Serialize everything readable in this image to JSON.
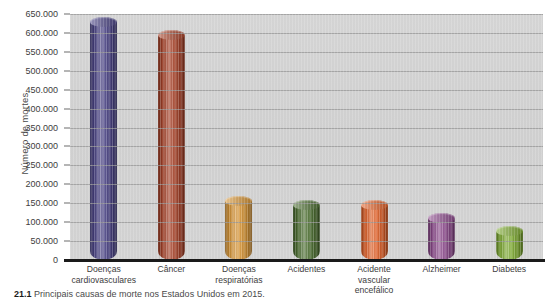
{
  "chart_data": {
    "type": "bar",
    "title": "",
    "xlabel": "",
    "ylabel": "Número de mortes",
    "ylim": [
      0,
      650000
    ],
    "grid": true,
    "legend": "none",
    "categories": [
      "Doenças cardiovasculares",
      "Câncer",
      "Doenças respiratórias",
      "Acidentes",
      "Acidente vascular encefálico",
      "Alzheimer",
      "Diabetes"
    ],
    "category_lines": [
      [
        "Doenças",
        "cardiovasculares"
      ],
      [
        "Câncer",
        ""
      ],
      [
        "Doenças",
        "respiratórias"
      ],
      [
        "Acidentes",
        ""
      ],
      [
        "Acidente",
        "vascular encefálico"
      ],
      [
        "Alzheimer",
        ""
      ],
      [
        "Diabetes",
        ""
      ]
    ],
    "values": [
      630000,
      595000,
      155000,
      146000,
      145000,
      110000,
      76000
    ],
    "bar_colors": [
      "#4b4486",
      "#a8432a",
      "#d79536",
      "#4e7033",
      "#e2622a",
      "#8e4c8e",
      "#7fab33"
    ],
    "tick_labels": [
      "0",
      "50.000",
      "100.000",
      "150.000",
      "200.000",
      "250.000",
      "300.000",
      "350.000",
      "400.000",
      "450.000",
      "500.000",
      "550.000",
      "600.000",
      "650.000"
    ],
    "tick_values": [
      0,
      50000,
      100000,
      150000,
      200000,
      250000,
      300000,
      350000,
      400000,
      450000,
      500000,
      550000,
      600000,
      650000
    ]
  },
  "caption": {
    "number": "21.1",
    "text": "Principais causas de morte nos Estados Unidos em 2015."
  }
}
